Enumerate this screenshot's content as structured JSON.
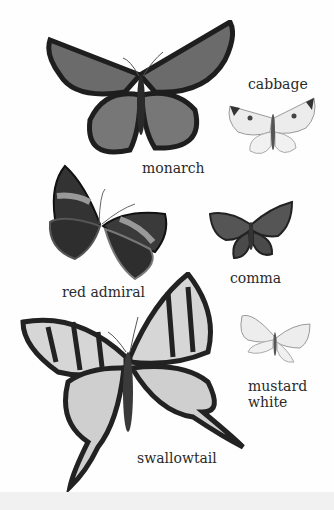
{
  "colors": {
    "background": "#fefefe",
    "ink": "#2a2a2a"
  },
  "specimens": [
    {
      "id": "monarch",
      "label": "monarch",
      "label_pos": [
        142,
        160
      ]
    },
    {
      "id": "cabbage",
      "label": "cabbage",
      "label_pos": [
        248,
        76
      ]
    },
    {
      "id": "red_admiral",
      "label": "red admiral",
      "label_pos": [
        62,
        284
      ]
    },
    {
      "id": "comma",
      "label": "comma",
      "label_pos": [
        230,
        270
      ]
    },
    {
      "id": "mustard_white",
      "label_lines": [
        "mustard",
        "white"
      ],
      "label_pos": [
        248,
        378
      ]
    },
    {
      "id": "swallowtail",
      "label": "swallowtail",
      "label_pos": [
        137,
        450
      ]
    }
  ]
}
